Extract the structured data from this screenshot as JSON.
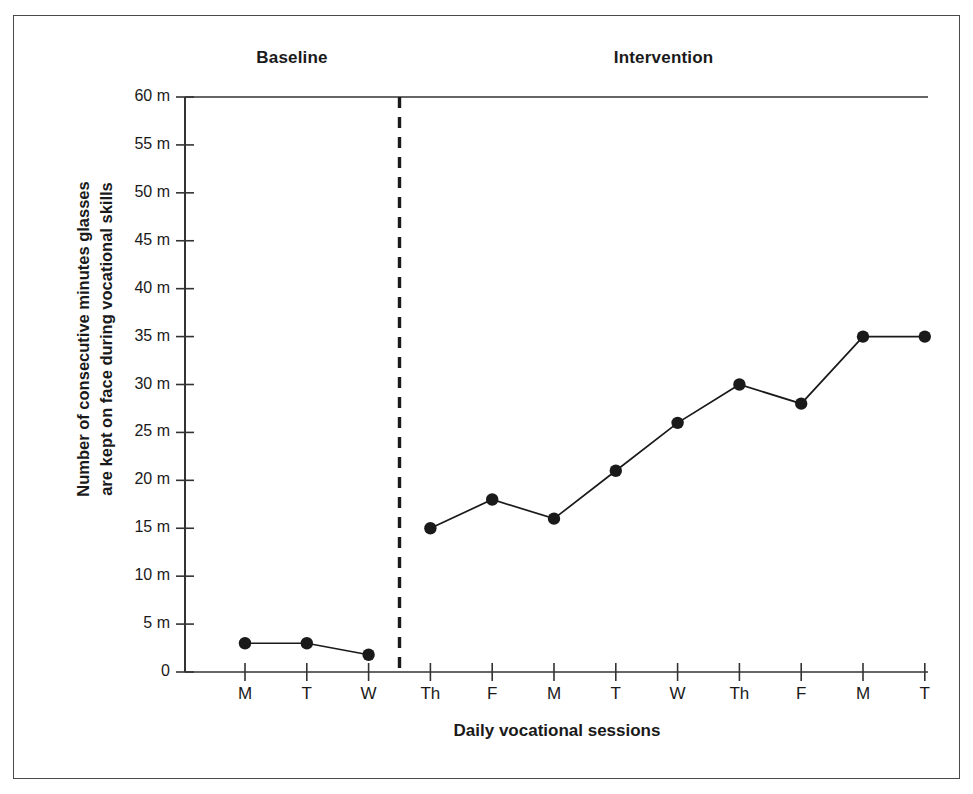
{
  "chart_data": {
    "type": "line",
    "title": "",
    "xlabel": "Daily vocational sessions",
    "ylabel": "Number of consecutive minutes glasses are kept on face during vocational skills",
    "ylabel_lines": [
      "Number of consecutive minutes glasses",
      "are kept on face during vocational skills"
    ],
    "ylim": [
      0,
      60
    ],
    "ytick_values": [
      0,
      5,
      10,
      15,
      20,
      25,
      30,
      35,
      40,
      45,
      50,
      55,
      60
    ],
    "ytick_labels": [
      "0",
      "5 m",
      "10 m",
      "15 m",
      "20 m",
      "25 m",
      "30 m",
      "35 m",
      "40 m",
      "45 m",
      "50 m",
      "55 m",
      "60 m"
    ],
    "categories": [
      "M",
      "T",
      "W",
      "Th",
      "F",
      "M",
      "T",
      "W",
      "Th",
      "F",
      "M",
      "T"
    ],
    "values": [
      3.0,
      3.0,
      1.8,
      15.0,
      18.0,
      16.0,
      21.0,
      26.0,
      30.0,
      28.0,
      35.0,
      35.0
    ],
    "grid": false,
    "legend": null,
    "marker": "filled-circle",
    "line_color": "#1a1a1a",
    "marker_color": "#1a1a1a",
    "phases": [
      {
        "name": "Baseline",
        "start_index": 0,
        "end_index": 2,
        "points": [
          3.0,
          3.0,
          1.8
        ]
      },
      {
        "name": "Intervention",
        "start_index": 3,
        "end_index": 11,
        "points": [
          15.0,
          18.0,
          16.0,
          21.0,
          26.0,
          30.0,
          28.0,
          35.0,
          35.0
        ]
      }
    ],
    "phase_divider": {
      "type": "vertical-dashed-line",
      "between_indices": [
        2,
        3
      ]
    },
    "annotations": []
  },
  "colors": {
    "ink": "#1a1a1a",
    "axis": "#333333",
    "frame": "#4a4a4a",
    "background": "#ffffff"
  }
}
